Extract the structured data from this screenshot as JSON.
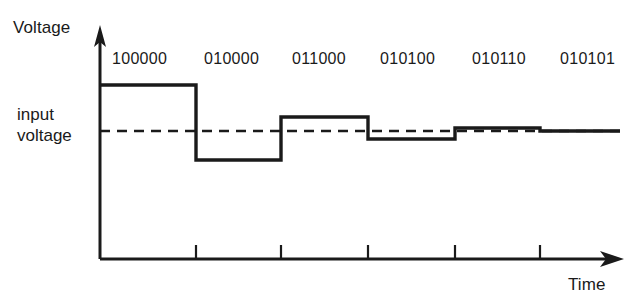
{
  "figure": {
    "axes": {
      "y_label": "Voltage",
      "x_label": "Time"
    },
    "reference_line": {
      "label_line1": "input",
      "label_line2": "voltage",
      "style": "dashed",
      "value_y": 131
    },
    "colors": {
      "ink": "#1a1a1a",
      "background": "#ffffff"
    }
  },
  "chart_data": {
    "type": "line",
    "xlabel": "Time",
    "ylabel": "Voltage",
    "grid": false,
    "legend": false,
    "annotations": [
      "input voltage"
    ],
    "categories": [
      "100000",
      "010000",
      "011000",
      "010100",
      "010110",
      "010101"
    ],
    "step_labels": [
      "100000",
      "010000",
      "011000",
      "010100",
      "010110",
      "010101"
    ],
    "label_x_positions": [
      112,
      204,
      292,
      380,
      472,
      560
    ],
    "step_boundaries_x": [
      100,
      196,
      281,
      368,
      455,
      540,
      620
    ],
    "step_levels_y": [
      85,
      160,
      117,
      139,
      128,
      131
    ],
    "input_voltage_y": 131,
    "tick_positions_x": [
      196,
      281,
      368,
      455,
      540
    ],
    "origin": [
      100,
      259
    ],
    "series": [
      {
        "name": "DAC output",
        "values": [
          85,
          160,
          117,
          139,
          128,
          131
        ]
      },
      {
        "name": "input voltage",
        "values": [
          131,
          131,
          131,
          131,
          131,
          131
        ]
      }
    ]
  }
}
